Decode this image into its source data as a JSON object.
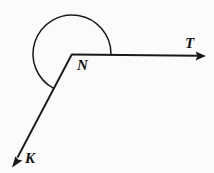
{
  "figure": {
    "name": "reflex-angle-diagram",
    "background_color": "#fbfbfb",
    "stroke_color": "#1a1a1a",
    "labels": {
      "vertex": "N",
      "ray_right": "T",
      "ray_lower_left": "K"
    },
    "vertex": {
      "x": 72,
      "y": 54
    },
    "rays": [
      {
        "name": "ray-NT",
        "label": "T",
        "from": {
          "x": 72,
          "y": 54
        },
        "to": {
          "x": 206,
          "y": 56
        },
        "arrow": "end",
        "direction": "right"
      },
      {
        "name": "ray-NK",
        "label": "K",
        "from": {
          "x": 72,
          "y": 54
        },
        "to": {
          "x": 12,
          "y": 167
        },
        "arrow": "end",
        "direction": "down-left"
      }
    ],
    "arc": {
      "name": "reflex-angle-arc",
      "center": {
        "x": 72,
        "y": 54
      },
      "radius": 39,
      "start_angle_deg": 0,
      "end_angle_deg": 242,
      "sweep": "counterclockwise",
      "marks": "reflex angle KNT"
    }
  }
}
